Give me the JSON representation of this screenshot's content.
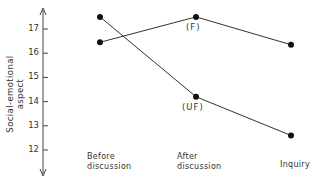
{
  "chart_data": {
    "type": "line",
    "title": "",
    "xlabel": "",
    "ylabel": "Social-emotional aspect",
    "categories": [
      "Before discussion",
      "After discussion",
      "Inquiry"
    ],
    "category_lines": [
      [
        "Before",
        "discussion"
      ],
      [
        "After",
        "discussion"
      ],
      [
        "Inquiry"
      ]
    ],
    "yticks": [
      12,
      13,
      14,
      15,
      16,
      17
    ],
    "ylim": [
      11.5,
      18
    ],
    "grid": false,
    "legend": "inline annotations",
    "series": [
      {
        "name": "(F)",
        "values": [
          16.45,
          17.5,
          16.35
        ]
      },
      {
        "name": "(UF)",
        "values": [
          17.5,
          14.2,
          12.6
        ]
      }
    ],
    "annotations": [
      {
        "text": "(F)",
        "series": 0,
        "point": 1
      },
      {
        "text": "(UF)",
        "series": 1,
        "point": 1
      }
    ]
  }
}
